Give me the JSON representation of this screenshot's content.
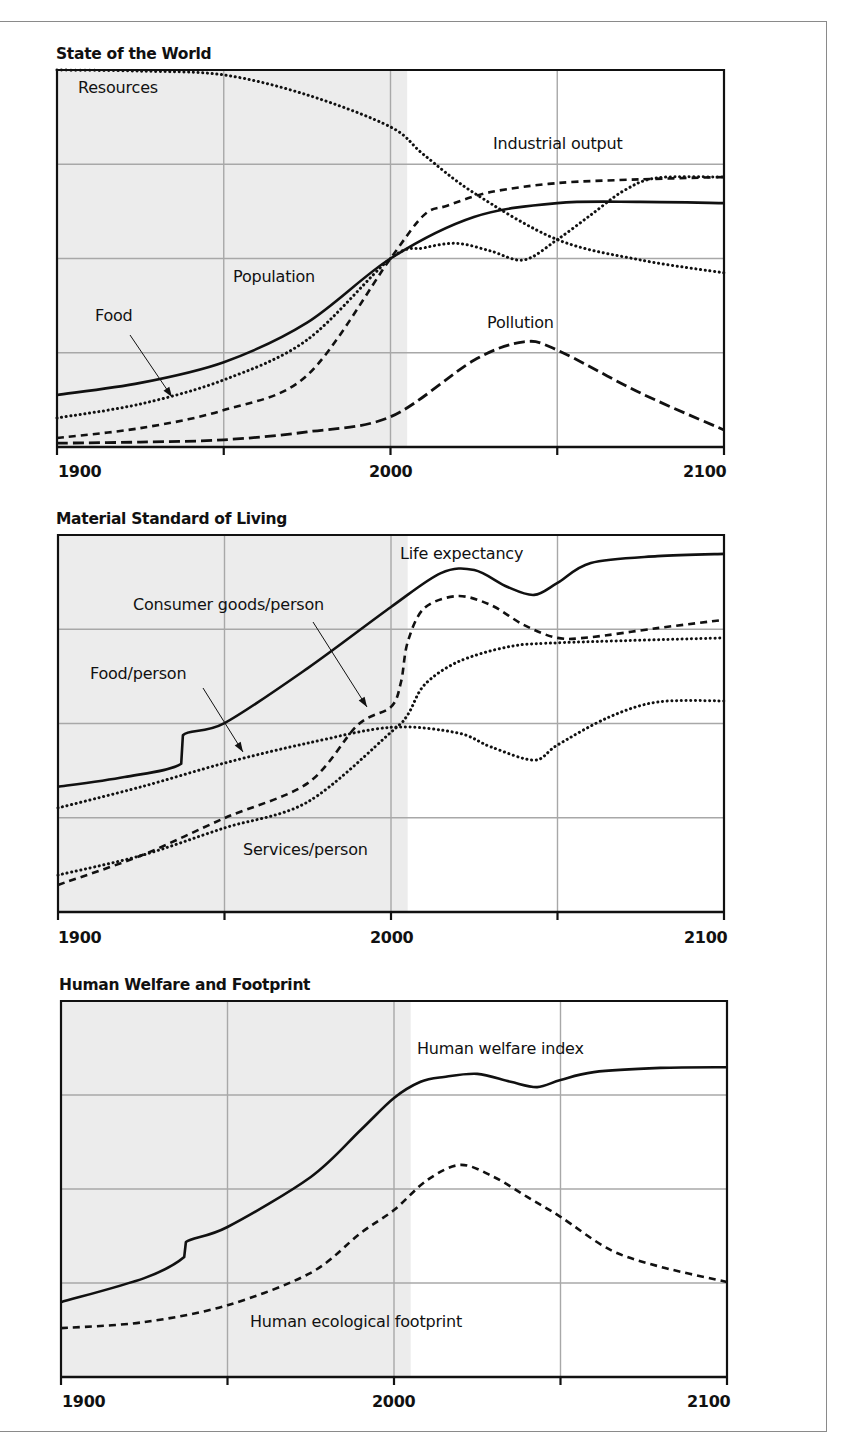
{
  "figure": {
    "panels": [
      {
        "title": "State of the World",
        "x_tick_labels": [
          "1900",
          "2000",
          "2100"
        ],
        "labels": {
          "resources": "Resources",
          "industrial_output": "Industrial output",
          "population": "Population",
          "food": "Food",
          "pollution": "Pollution"
        }
      },
      {
        "title": "Material Standard of Living",
        "x_tick_labels": [
          "1900",
          "2000",
          "2100"
        ],
        "labels": {
          "life_expectancy": "Life expectancy",
          "consumer_goods": "Consumer goods/person",
          "food_per_person": "Food/person",
          "services_per_person": "Services/person"
        }
      },
      {
        "title": "Human Welfare and Footprint",
        "x_tick_labels": [
          "1900",
          "2000",
          "2100"
        ],
        "labels": {
          "welfare": "Human welfare index",
          "footprint": "Human ecological footprint"
        }
      }
    ],
    "colors": {
      "line": "#111111",
      "grid": "#a8a8a8",
      "history_shade": "#ececec",
      "frame": "#8a8a8a"
    }
  },
  "chart_data": [
    {
      "type": "line",
      "title": "State of the World",
      "xlabel": "",
      "ylabel": "",
      "xlim": [
        1900,
        2100
      ],
      "ylim": [
        0,
        100
      ],
      "x_ticks": [
        1900,
        1950,
        2000,
        2050,
        2100
      ],
      "x_tick_labels": [
        "1900",
        "2000",
        "2100"
      ],
      "grid": true,
      "historical_shading_until": 2005,
      "series": [
        {
          "name": "Resources",
          "style": "dotted",
          "x": [
            1900,
            1925,
            1950,
            1975,
            2000,
            2010,
            2025,
            2050,
            2075,
            2100
          ],
          "values": [
            100,
            99.7,
            98.7,
            93.4,
            84.9,
            77.5,
            67.4,
            55,
            49.6,
            46.2
          ]
        },
        {
          "name": "Industrial output",
          "style": "dashed",
          "x": [
            1900,
            1925,
            1950,
            1975,
            2000,
            2010,
            2017,
            2030,
            2050,
            2075,
            2100
          ],
          "values": [
            2.4,
            5,
            9.8,
            19,
            50,
            61.5,
            64,
            67.6,
            70,
            71,
            71.6
          ]
        },
        {
          "name": "Population",
          "style": "solid",
          "x": [
            1900,
            1925,
            1950,
            1975,
            2000,
            2025,
            2050,
            2075,
            2100
          ],
          "values": [
            13.8,
            17,
            22.5,
            33,
            50,
            61,
            64.7,
            65,
            64.7
          ]
        },
        {
          "name": "Food",
          "style": "dotted",
          "x": [
            1900,
            1925,
            1950,
            1975,
            2000,
            2010,
            2020,
            2030,
            2040,
            2050,
            2060,
            2070,
            2080,
            2100
          ],
          "values": [
            7.7,
            11.4,
            17.8,
            28.4,
            50,
            52.8,
            54,
            52,
            49.6,
            55,
            61.5,
            68,
            71.4,
            71.6
          ]
        },
        {
          "name": "Pollution",
          "style": "longdash",
          "x": [
            1900,
            1925,
            1950,
            1975,
            2000,
            2025,
            2040,
            2050,
            2075,
            2100
          ],
          "values": [
            1,
            1.3,
            1.9,
            4,
            8,
            23,
            27.9,
            25.7,
            14.3,
            4.5
          ]
        }
      ]
    },
    {
      "type": "line",
      "title": "Material Standard of Living",
      "xlabel": "",
      "ylabel": "",
      "xlim": [
        1900,
        2100
      ],
      "ylim": [
        0,
        100
      ],
      "x_ticks": [
        1900,
        1950,
        2000,
        2050,
        2100
      ],
      "x_tick_labels": [
        "1900",
        "2000",
        "2100"
      ],
      "grid": true,
      "historical_shading_until": 2005,
      "series": [
        {
          "name": "Life expectancy",
          "style": "solid",
          "x": [
            1900,
            1920,
            1937,
            1937.5,
            1950,
            1975,
            2000,
            2015,
            2025,
            2035,
            2043,
            2050,
            2060,
            2080,
            2100
          ],
          "values": [
            33.2,
            35.8,
            39.3,
            46.9,
            50.1,
            64.7,
            80.9,
            89.9,
            90.7,
            86.2,
            84.1,
            87.3,
            92.6,
            94.4,
            95
          ]
        },
        {
          "name": "Consumer goods/person",
          "style": "dashed",
          "x": [
            1900,
            1925,
            1950,
            1975,
            1990,
            2000,
            2003,
            2005,
            2010,
            2020,
            2030,
            2040,
            2050,
            2060,
            2080,
            2100
          ],
          "values": [
            7.2,
            15,
            24.9,
            34.2,
            49.6,
            54.4,
            61,
            71.6,
            80.6,
            83.8,
            81.4,
            76.1,
            72.7,
            72.9,
            75.3,
            77.5
          ]
        },
        {
          "name": "Food/person",
          "style": "dotted",
          "x": [
            1900,
            1925,
            1950,
            1975,
            2000,
            2020,
            2030,
            2043,
            2050,
            2065,
            2080,
            2100
          ],
          "values": [
            27.6,
            33.2,
            39.5,
            44.8,
            49,
            47.5,
            43.8,
            40.3,
            44.3,
            51.5,
            55.7,
            56
          ]
        },
        {
          "name": "Services/person",
          "style": "dotted",
          "x": [
            1900,
            1925,
            1950,
            1975,
            2000,
            2005,
            2010,
            2020,
            2035,
            2050,
            2100
          ],
          "values": [
            9.8,
            15,
            22.3,
            29.2,
            47.7,
            52.3,
            60.2,
            66.3,
            70.3,
            71.4,
            72.7
          ]
        }
      ]
    },
    {
      "type": "line",
      "title": "Human Welfare and Footprint",
      "xlabel": "",
      "ylabel": "",
      "xlim": [
        1900,
        2100
      ],
      "ylim": [
        0,
        100
      ],
      "x_ticks": [
        1900,
        1950,
        2000,
        2050,
        2100
      ],
      "x_tick_labels": [
        "1900",
        "2000",
        "2100"
      ],
      "grid": true,
      "historical_shading_until": 2005,
      "series": [
        {
          "name": "Human welfare index",
          "style": "solid",
          "x": [
            1900,
            1925,
            1937,
            1937.5,
            1950,
            1975,
            1990,
            2000,
            2008,
            2015,
            2025,
            2035,
            2043,
            2050,
            2060,
            2080,
            2100
          ],
          "values": [
            19.9,
            26.3,
            31.9,
            35.9,
            39.9,
            53.2,
            65.7,
            74.2,
            78.5,
            79.8,
            80.6,
            78.5,
            77.1,
            79,
            81.1,
            82.2,
            82.4
          ]
        },
        {
          "name": "Human ecological footprint",
          "style": "dashed",
          "x": [
            1900,
            1925,
            1950,
            1975,
            1990,
            2000,
            2010,
            2020,
            2030,
            2040,
            2050,
            2065,
            2080,
            2100
          ],
          "values": [
            13,
            14.6,
            19.1,
            27.7,
            38.3,
            44.4,
            52.4,
            56.4,
            53.2,
            47.9,
            42.6,
            33.8,
            29.3,
            25.3
          ]
        }
      ]
    }
  ]
}
